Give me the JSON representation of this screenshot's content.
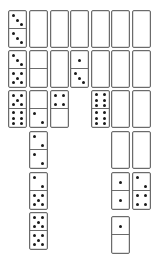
{
  "game": {
    "title": "Domino solitaire",
    "colors": {
      "background": "#ffffff",
      "tile_border": "#6b6b6b",
      "pip": "#1a1a1a"
    },
    "tile_size": {
      "width": 19,
      "height": 38
    },
    "columns": [
      {
        "x": 8,
        "tiles": [
          {
            "y": 10,
            "top": 3,
            "bottom": 3,
            "face_up": true
          },
          {
            "y": 50,
            "top": 3,
            "bottom": 5,
            "face_up": true
          },
          {
            "y": 90,
            "top": 5,
            "bottom": 6,
            "face_up": true
          }
        ]
      },
      {
        "x": 29,
        "tiles": [
          {
            "y": 10,
            "face_up": false
          },
          {
            "y": 50,
            "top": 0,
            "bottom": 0,
            "face_up": true
          },
          {
            "y": 90,
            "top": 0,
            "bottom": 2,
            "face_up": true
          },
          {
            "y": 131,
            "top": 2,
            "bottom": 2,
            "face_up": true
          },
          {
            "y": 172,
            "top": 2,
            "bottom": 5,
            "face_up": true
          },
          {
            "y": 212,
            "top": 5,
            "bottom": 5,
            "face_up": true
          }
        ]
      },
      {
        "x": 50,
        "tiles": [
          {
            "y": 10,
            "face_up": false
          },
          {
            "y": 50,
            "face_up": false
          },
          {
            "y": 90,
            "top": 4,
            "bottom": 0,
            "face_up": true
          }
        ]
      },
      {
        "x": 70,
        "tiles": [
          {
            "y": 10,
            "face_up": false
          },
          {
            "y": 50,
            "top": 1,
            "bottom": 3,
            "face_up": true
          }
        ]
      },
      {
        "x": 91,
        "tiles": [
          {
            "y": 10,
            "face_up": false
          },
          {
            "y": 50,
            "face_up": false
          },
          {
            "y": 90,
            "top": 6,
            "bottom": 6,
            "face_up": true
          }
        ]
      },
      {
        "x": 111,
        "tiles": [
          {
            "y": 10,
            "face_up": false
          },
          {
            "y": 50,
            "face_up": false
          },
          {
            "y": 90,
            "face_up": false
          },
          {
            "y": 131,
            "face_up": false
          },
          {
            "y": 172,
            "top": 1,
            "bottom": 1,
            "face_up": true
          },
          {
            "y": 216,
            "top": 1,
            "bottom": 0,
            "face_up": true
          }
        ]
      },
      {
        "x": 132,
        "tiles": [
          {
            "y": 10,
            "face_up": false
          },
          {
            "y": 50,
            "face_up": false
          },
          {
            "y": 90,
            "face_up": false
          },
          {
            "y": 131,
            "face_up": false
          },
          {
            "y": 172,
            "top": 2,
            "bottom": 4,
            "face_up": true
          }
        ]
      }
    ]
  }
}
